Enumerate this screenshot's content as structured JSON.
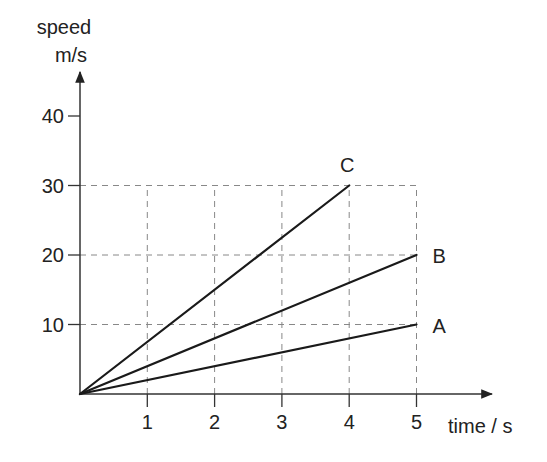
{
  "chart_data": {
    "type": "line",
    "title": "",
    "xlabel": "time / s",
    "ylabel_line1": "speed",
    "ylabel_line2": "m/s",
    "ylabel": "speed m/s",
    "x_ticks": [
      1,
      2,
      3,
      4,
      5
    ],
    "y_ticks": [
      10,
      20,
      30,
      40
    ],
    "xlim": [
      0,
      5
    ],
    "ylim": [
      0,
      40
    ],
    "grid": "dashed at gridline values up to the line endpoints",
    "legend": "inline labels at line ends",
    "series": [
      {
        "name": "A",
        "x": [
          0,
          5
        ],
        "y": [
          0,
          10
        ]
      },
      {
        "name": "B",
        "x": [
          0,
          5
        ],
        "y": [
          0,
          20
        ]
      },
      {
        "name": "C",
        "x": [
          0,
          4
        ],
        "y": [
          0,
          30
        ]
      }
    ],
    "colors": {
      "line": "#1a1a1a",
      "axis": "#333333",
      "grid": "#888888",
      "text": "#222222"
    }
  }
}
